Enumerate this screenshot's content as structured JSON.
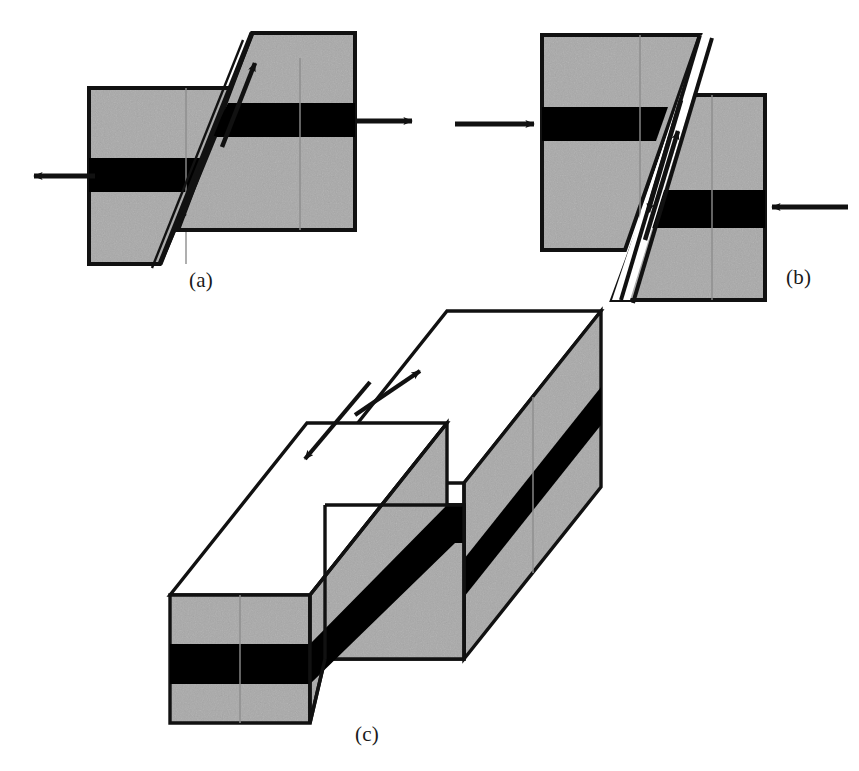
{
  "figure": {
    "type": "diagram",
    "background_color": "#ffffff",
    "stroke_color": "#111111",
    "rock_fill_color": "#a9a9a9",
    "marker_bed_color": "#000000",
    "top_surface_color": "#ffffff",
    "panels": [
      {
        "id": "a",
        "label": "(a)",
        "fault_type": "normal-fault",
        "stress_regime": "extension",
        "arrows": [
          {
            "name": "extension-arrow-left",
            "direction": "left"
          },
          {
            "name": "extension-arrow-right",
            "direction": "right"
          }
        ],
        "slip_indicators": [
          {
            "name": "slip-arrow-up-dip",
            "direction": "up-right"
          },
          {
            "name": "slip-arrow-down-dip",
            "direction": "down-left"
          }
        ],
        "blocks": [
          "hanging-wall-left-block",
          "footwall-right-block"
        ]
      },
      {
        "id": "b",
        "label": "(b)",
        "fault_type": "reverse-fault",
        "stress_regime": "compression",
        "arrows": [
          {
            "name": "compression-arrow-left",
            "direction": "right"
          },
          {
            "name": "compression-arrow-right",
            "direction": "left"
          }
        ],
        "slip_indicators": [
          {
            "name": "slip-arrow-down-dip",
            "direction": "down-left"
          },
          {
            "name": "slip-arrow-up-dip",
            "direction": "up-right"
          }
        ],
        "blocks": [
          "hanging-wall-left-block",
          "footwall-right-block"
        ]
      },
      {
        "id": "c",
        "label": "(c)",
        "fault_type": "strike-slip-fault",
        "stress_regime": "shear",
        "arrows": [
          {
            "name": "strike-slip-arrow-near",
            "direction": "down-left"
          },
          {
            "name": "strike-slip-arrow-far",
            "direction": "up-right"
          }
        ],
        "blocks": [
          "near-block",
          "far-block"
        ]
      }
    ]
  }
}
